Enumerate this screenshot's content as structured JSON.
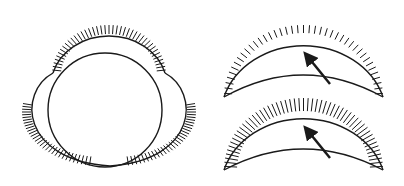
{
  "figure": {
    "stroke_color": "#1a1a1a",
    "background": "#ffffff",
    "panels": [
      {
        "name": "three-lobe-circle",
        "hatched_lobes": 3
      },
      {
        "name": "crescent-top",
        "hatch_density": "sparse",
        "arrow": "up-left"
      },
      {
        "name": "crescent-bottom",
        "hatch_density": "dense",
        "arrow": "up-left"
      }
    ]
  }
}
